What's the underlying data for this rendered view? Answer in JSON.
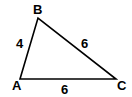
{
  "diagram": {
    "type": "triangle",
    "vertices": [
      {
        "label": "A",
        "x": 20,
        "y": 79,
        "lx": 13,
        "ly": 89
      },
      {
        "label": "B",
        "x": 38,
        "y": 18,
        "lx": 36,
        "ly": 14
      },
      {
        "label": "C",
        "x": 116,
        "y": 79,
        "lx": 119,
        "ly": 89
      }
    ],
    "sides": [
      {
        "name": "AB",
        "length": "4",
        "lx": 19,
        "ly": 48
      },
      {
        "name": "BC",
        "length": "6",
        "lx": 85,
        "ly": 48
      },
      {
        "name": "AC",
        "length": "6",
        "lx": 65,
        "ly": 93
      }
    ],
    "stroke_color": "#000000"
  }
}
